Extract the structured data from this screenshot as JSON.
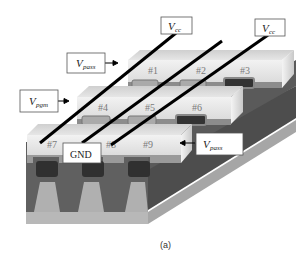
{
  "figure": {
    "caption": "(a)",
    "labels": {
      "vcc_1": {
        "main": "V",
        "sub": "cc"
      },
      "vcc_2": {
        "main": "V",
        "sub": "cc"
      },
      "vpass_top": {
        "main": "V",
        "sub": "pass"
      },
      "vpgm": {
        "main": "V",
        "sub": "pgm"
      },
      "gnd": "GND",
      "vpass_right": {
        "main": "V",
        "sub": "pass"
      }
    },
    "cells": [
      "#1",
      "#2",
      "#3",
      "#4",
      "#5",
      "#6",
      "#7",
      "#8",
      "#9"
    ],
    "colors": {
      "wordline_top": "#d8d8d8",
      "wordline_front": "#ececec",
      "substrate_dark": "#5e5e5e",
      "substrate_side": "#4a4a4a",
      "base_light": "#b5b5b5",
      "floating_gate": "#2f2f2f",
      "bitline": "#000000"
    }
  }
}
